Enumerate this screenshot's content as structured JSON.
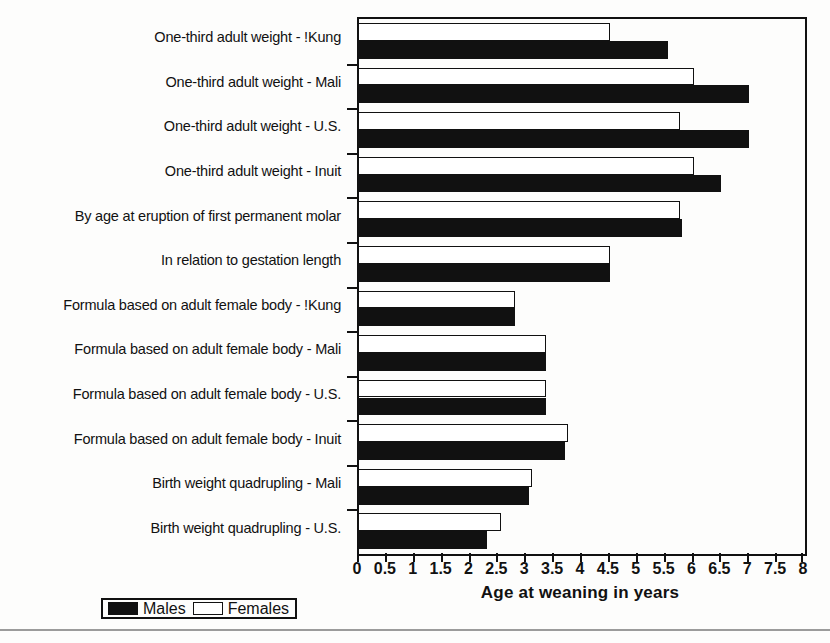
{
  "chart_data": {
    "type": "bar",
    "orientation": "horizontal",
    "title": "",
    "xlabel": "Age at weaning in years",
    "ylabel": "",
    "xlim": [
      0,
      8
    ],
    "xticks": [
      0,
      0.5,
      1,
      1.5,
      2,
      2.5,
      3,
      3.5,
      4,
      4.5,
      5,
      5.5,
      6,
      6.5,
      7,
      7.5,
      8
    ],
    "xticklabels": [
      "0",
      "0.5",
      "1",
      "1.5",
      "2",
      "2.5",
      "3",
      "3.5",
      "4",
      "4.5",
      "5",
      "5.5",
      "6",
      "6.5",
      "7",
      "7.5",
      "8"
    ],
    "grid": false,
    "legend_position": "bottom-left",
    "categories": [
      "One-third adult weight - !Kung",
      "One-third adult weight - Mali",
      "One-third adult weight - U.S.",
      "One-third adult weight - Inuit",
      "By age at eruption of first permanent molar",
      "In relation to gestation length",
      "Formula based on adult female body - !Kung",
      "Formula based on adult female body - Mali",
      "Formula based on adult female body - U.S.",
      "Formula based on adult female body - Inuit",
      "Birth weight quadrupling - Mali",
      "Birth weight quadrupling - U.S."
    ],
    "series": [
      {
        "name": "Females",
        "color": "#ffffff",
        "values": [
          4.5,
          6.0,
          5.75,
          6.0,
          5.75,
          4.5,
          2.8,
          3.35,
          3.35,
          3.75,
          3.1,
          2.55
        ]
      },
      {
        "name": "Males",
        "color": "#111111",
        "values": [
          5.55,
          7.0,
          7.0,
          6.5,
          5.8,
          4.5,
          2.8,
          3.35,
          3.35,
          3.7,
          3.05,
          2.3
        ]
      }
    ]
  },
  "legend": {
    "males_label": "Males",
    "females_label": "Females"
  }
}
